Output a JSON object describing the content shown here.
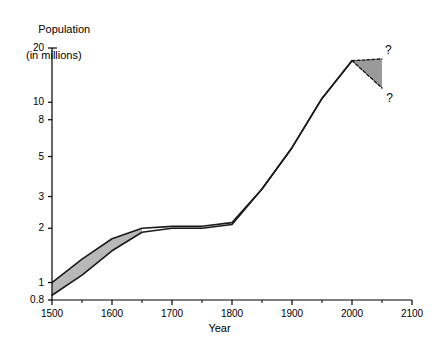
{
  "chart_data": {
    "type": "line",
    "title": "",
    "ylabel_line1": "Population",
    "ylabel_line2": "(in millions)",
    "xlabel": "Year",
    "grid": false,
    "legend": false,
    "yscale": "log",
    "xlim": [
      1500,
      2100
    ],
    "ylim": [
      0.8,
      20
    ],
    "yticks": [
      {
        "value": 20,
        "label": "20"
      },
      {
        "value": 10,
        "label": "10"
      },
      {
        "value": 8,
        "label": "8"
      },
      {
        "value": 5,
        "label": "5"
      },
      {
        "value": 3,
        "label": "3"
      },
      {
        "value": 2,
        "label": "2"
      },
      {
        "value": 1,
        "label": "1"
      },
      {
        "value": 0.8,
        "label": "0.8"
      }
    ],
    "xticks": [
      {
        "value": 1500,
        "label": "1500"
      },
      {
        "value": 1600,
        "label": "1600"
      },
      {
        "value": 1700,
        "label": "1700"
      },
      {
        "value": 1800,
        "label": "1800"
      },
      {
        "value": 1900,
        "label": "1900"
      },
      {
        "value": 2000,
        "label": "2000"
      },
      {
        "value": 2100,
        "label": "2100"
      }
    ],
    "xminorticks": [
      1550,
      1650,
      1750,
      1850,
      1950,
      2050
    ],
    "series": [
      {
        "name": "upper-estimate",
        "style": "solid",
        "x": [
          1500,
          1550,
          1600,
          1650,
          1700,
          1750,
          1800,
          1850,
          1900,
          1950,
          2000
        ],
        "values": [
          1.0,
          1.35,
          1.75,
          2.0,
          2.05,
          2.05,
          2.15,
          3.3,
          5.6,
          10.5,
          17.0
        ]
      },
      {
        "name": "lower-estimate",
        "style": "solid",
        "x": [
          1500,
          1550,
          1600,
          1650,
          1700,
          1750,
          1800,
          1850,
          1900,
          1950,
          2000
        ],
        "values": [
          0.85,
          1.1,
          1.5,
          1.9,
          2.0,
          2.0,
          2.1,
          3.3,
          5.6,
          10.5,
          17.0
        ]
      },
      {
        "name": "projection-upper",
        "style": "dashed",
        "x": [
          2000,
          2050
        ],
        "values": [
          17.0,
          17.4
        ]
      },
      {
        "name": "projection-lower",
        "style": "dashed",
        "x": [
          2000,
          2050
        ],
        "values": [
          17.0,
          12.0
        ]
      }
    ],
    "bands": [
      {
        "name": "historical-uncertainty-band",
        "fill": "#b8b8b8",
        "x": [
          1500,
          1550,
          1600,
          1650
        ],
        "upper": [
          1.0,
          1.35,
          1.75,
          2.0
        ],
        "lower": [
          0.85,
          1.1,
          1.5,
          1.9
        ]
      },
      {
        "name": "projection-uncertainty-fan",
        "fill": "#9a9a9a",
        "x": [
          2000,
          2050
        ],
        "upper": [
          17.0,
          17.4
        ],
        "lower": [
          17.0,
          12.0
        ]
      }
    ],
    "annotations": [
      {
        "name": "upper-question-mark",
        "text": "?",
        "x": 2060,
        "y": 19.2
      },
      {
        "name": "lower-question-mark",
        "text": "?",
        "x": 2062,
        "y": 10.4
      }
    ]
  },
  "colors": {
    "axis": "#000000",
    "line": "#1a1a1a",
    "band_fill": "#b8b8b8",
    "fan_fill": "#9a9a9a",
    "background": "#ffffff"
  }
}
